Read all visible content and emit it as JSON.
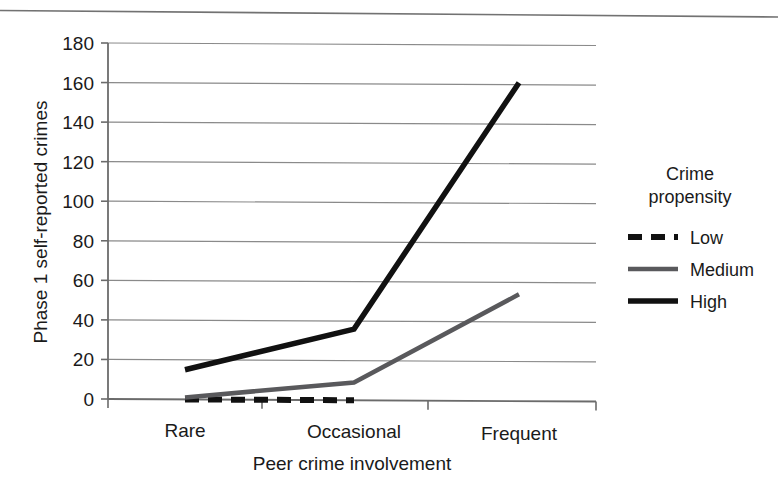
{
  "chart_data": {
    "type": "line",
    "title": "",
    "xlabel": "Peer crime involvement",
    "ylabel": "Phase 1 self-reported crimes",
    "categories": [
      "Rare",
      "Occasional",
      "Frequent"
    ],
    "ylim": [
      0,
      180
    ],
    "yticks": [
      0,
      20,
      40,
      60,
      80,
      100,
      120,
      140,
      160,
      180
    ],
    "ytick_labels": [
      "0",
      "20",
      "40",
      "60",
      "80",
      "100",
      "120",
      "140",
      "160",
      "180"
    ],
    "grid": true,
    "legend_position": "right",
    "legend_title": "Crime propensity",
    "series": [
      {
        "name": "Low",
        "values": [
          0,
          0,
          0
        ],
        "style": "dashed",
        "color": "#111111",
        "width": 6,
        "dash": "14 9",
        "draw_segments": [
          0,
          1
        ]
      },
      {
        "name": "Medium",
        "values": [
          1,
          9,
          54
        ],
        "style": "solid",
        "color": "#59595c",
        "width": 4.5,
        "dash": "",
        "draw_segments": [
          0,
          1,
          2
        ]
      },
      {
        "name": "High",
        "values": [
          15,
          36,
          161
        ],
        "style": "solid",
        "color": "#111111",
        "width": 5.5,
        "dash": "",
        "draw_segments": [
          0,
          1,
          2
        ]
      }
    ]
  },
  "legend": {
    "title_line1": "Crime",
    "title_line2": "propensity",
    "entries": [
      {
        "label": "Low"
      },
      {
        "label": "Medium"
      },
      {
        "label": "High"
      }
    ]
  },
  "axes": {
    "y_title": "Phase 1 self-reported crimes",
    "x_title": "Peer crime involvement",
    "y_ticks": [
      "180",
      "160",
      "140",
      "120",
      "100",
      "80",
      "60",
      "40",
      "20",
      "0"
    ],
    "x_categories": [
      "Rare",
      "Occasional",
      "Frequent"
    ]
  },
  "colors": {
    "axis": "#6b6b6b",
    "grid": "#8a8a8a",
    "high_series": "#111111",
    "medium_series": "#59595c",
    "low_series": "#111111",
    "text": "#1a1a1a",
    "background": "#ffffff"
  }
}
